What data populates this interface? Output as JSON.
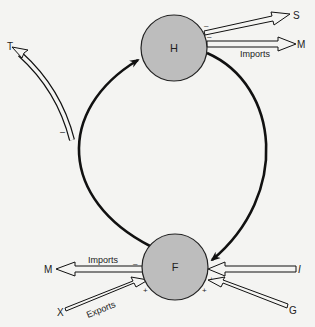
{
  "diagram": {
    "type": "circular-flow",
    "colors": {
      "background": "#f4f4f2",
      "node_fill": "#bdbdbd",
      "stroke": "#111111"
    },
    "nodes": {
      "households": {
        "label": "H"
      },
      "firms": {
        "label": "F"
      }
    },
    "circular_flow": {
      "direction": "clockwise"
    },
    "leakages": {
      "savings": {
        "label": "S",
        "sign": "–"
      },
      "household_imports": {
        "label": "M",
        "caption": "Imports",
        "sign": "–"
      },
      "taxes": {
        "label": "T",
        "sign": "–"
      },
      "firm_imports": {
        "label": "M",
        "caption": "Imports",
        "sign": "–"
      }
    },
    "injections": {
      "investment": {
        "label": "I",
        "sign": "+"
      },
      "government": {
        "label": "G",
        "sign": "+"
      },
      "exports": {
        "label": "X",
        "caption": "Exports",
        "sign": "+"
      }
    }
  }
}
